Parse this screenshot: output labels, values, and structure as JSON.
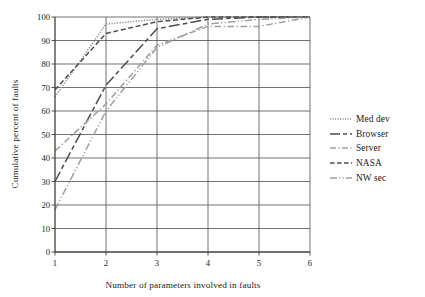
{
  "chart_data": {
    "type": "line",
    "title": "",
    "xlabel": "Number of parameters involved in faults",
    "ylabel": "Cumulative percent of faults",
    "x": [
      1,
      2,
      3,
      4,
      5,
      6
    ],
    "xlim": [
      1,
      6
    ],
    "ylim": [
      0,
      100
    ],
    "xticks": [
      "1",
      "2",
      "3",
      "4",
      "5",
      "6"
    ],
    "yticks": [
      "0",
      "10",
      "20",
      "30",
      "40",
      "50",
      "60",
      "70",
      "80",
      "90",
      "100"
    ],
    "grid": "horizontal-and-vertical",
    "legend_position": "right",
    "series": [
      {
        "name": "Med dev",
        "style": "dotted",
        "color": "#8c8c8c",
        "values": [
          66,
          97,
          99,
          100,
          100,
          100
        ]
      },
      {
        "name": "Browser",
        "style": "long-dash",
        "color": "#4d4d4d",
        "values": [
          30,
          71,
          95,
          99,
          100,
          100
        ]
      },
      {
        "name": "Server",
        "style": "dash-dot",
        "color": "#9e9e9e",
        "values": [
          43,
          63,
          88,
          96,
          96,
          100
        ]
      },
      {
        "name": "NASA",
        "style": "dashed",
        "color": "#4d4d4d",
        "values": [
          69,
          93,
          98,
          100,
          100,
          100
        ]
      },
      {
        "name": "NW sec",
        "style": "dash-dot-dot",
        "color": "#9e9e9e",
        "values": [
          18,
          60,
          87,
          97,
          99,
          100
        ]
      }
    ]
  },
  "legend": {
    "items": [
      {
        "label": "Med dev"
      },
      {
        "label": "Browser"
      },
      {
        "label": "Server"
      },
      {
        "label": "NASA"
      },
      {
        "label": "NW sec"
      }
    ]
  }
}
